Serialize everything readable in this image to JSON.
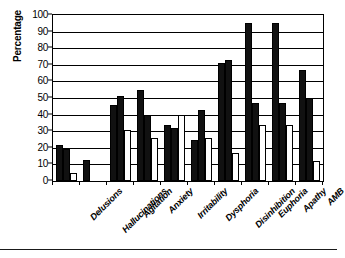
{
  "chart_data": {
    "type": "bar",
    "title": "",
    "xlabel": "",
    "ylabel": "Percentage",
    "ylim": [
      0,
      100
    ],
    "ytick_step": 10,
    "ytick_labels": [
      "100",
      "90",
      "80",
      "70",
      "60",
      "50",
      "40",
      "30",
      "20",
      "10",
      "0"
    ],
    "grid": true,
    "legend": "none",
    "orientation": "vertical",
    "grouping": "clustered",
    "categories": [
      "Delusions",
      "Hallucinations",
      "Agitation",
      "Anxiety",
      "Irritability",
      "Dysphoria",
      "Disinhibition",
      "Euphoria",
      "Apathy",
      "AMB"
    ],
    "series": [
      {
        "name": "Series 1",
        "color": "#111111",
        "fill": "solid-black",
        "values": [
          21.5,
          12.5,
          46,
          55,
          34,
          25,
          71,
          95,
          95,
          67
        ]
      },
      {
        "name": "Series 2",
        "color": "#111111",
        "fill": "solid-black",
        "values": [
          19,
          0,
          51,
          40,
          32,
          43,
          73,
          47,
          47,
          50
        ]
      },
      {
        "name": "Series 3",
        "color": "#ffffff",
        "fill": "white-outlined",
        "values": [
          5,
          0,
          31,
          26,
          40,
          26,
          17,
          34,
          34,
          12
        ]
      }
    ]
  },
  "colors": {
    "axis": "#000000",
    "grid": "#000000",
    "series_dark": "#111111",
    "series_light": "#ffffff",
    "background": "#ffffff"
  }
}
